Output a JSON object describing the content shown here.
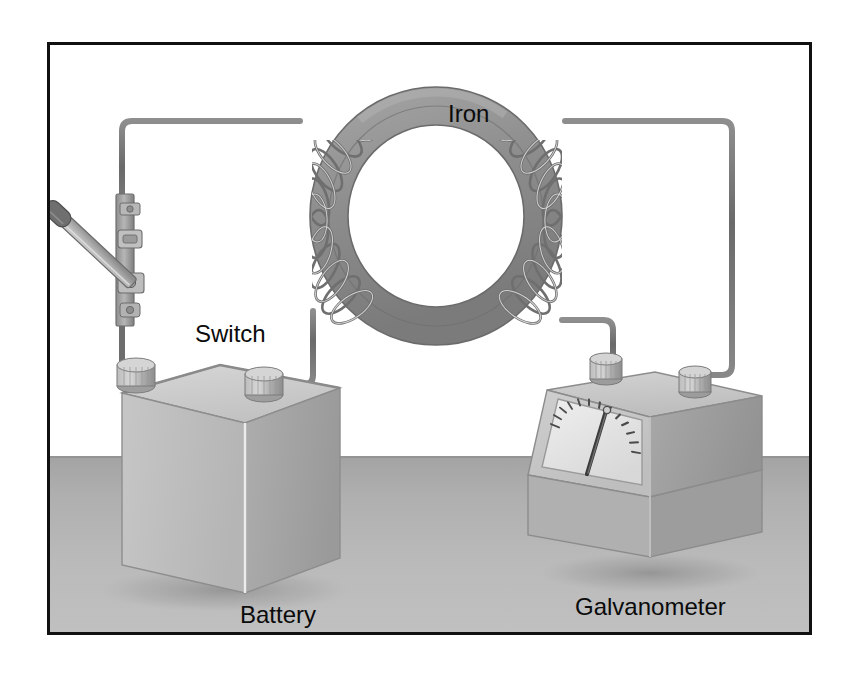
{
  "figure": {
    "domain": "diagram",
    "caption_labels": {
      "iron": "Iron",
      "switch": "Switch",
      "battery": "Battery",
      "galvanometer": "Galvanometer"
    },
    "frame": {
      "border_color": "#111111",
      "background_color": "#ffffff",
      "x": 47,
      "y": 42,
      "width": 765,
      "height": 593
    },
    "scene": {
      "floor_color_near": "#b8b8b8",
      "floor_color_far": "#a6a6a6",
      "floor_horizon_y": 453,
      "wall_color": "#ffffff"
    },
    "components": [
      {
        "name": "iron-ring",
        "label": "Iron",
        "type": "toroidal-iron-core",
        "color": "#8f8f8f",
        "outline_color": "#6a6a6a",
        "center_x": 433,
        "center_y": 213,
        "outer_rx": 126,
        "outer_ry": 128,
        "tube_thickness": 38
      },
      {
        "name": "primary-coil",
        "label": "",
        "type": "wire-winding",
        "side": "left",
        "turns": 16,
        "color": "#7e7e7e"
      },
      {
        "name": "secondary-coil",
        "label": "",
        "type": "wire-winding",
        "side": "right",
        "turns": 16,
        "color": "#7e7e7e"
      },
      {
        "name": "battery",
        "label": "Battery",
        "type": "wet-cell-battery",
        "terminals": 2,
        "top_face_color": "#c9c9c9",
        "left_face_color": "#bdbdbd",
        "right_face_color": "#a9a9a9"
      },
      {
        "name": "switch",
        "label": "Switch",
        "type": "knife-switch",
        "state": "open",
        "blade_color": "#b4b4b4",
        "handle_color": "#6f6f6f"
      },
      {
        "name": "galvanometer",
        "label": "Galvanometer",
        "type": "analog-meter",
        "terminals": 2,
        "dial_tick_count": 13,
        "needle_direction": "up-slightly-right",
        "dial_face_color": "#e6e6e6",
        "body_color": "#c4c4c4"
      },
      {
        "name": "circuit-wire",
        "label": "",
        "type": "conductor",
        "color": "#6d6d6d"
      }
    ],
    "colors": {
      "wire": "#6d6d6d",
      "iron": "#8f8f8f",
      "coil": "#7e7e7e",
      "label_text": "#0b0b0b",
      "frame": "#111111"
    }
  }
}
